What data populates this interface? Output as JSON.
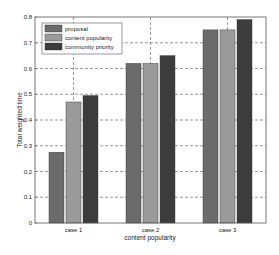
{
  "chart_data": {
    "type": "bar",
    "title": "",
    "xlabel": "content popularity",
    "ylabel": "Total weighted time",
    "categories": [
      "case 1",
      "case 2",
      "case 3"
    ],
    "series": [
      {
        "name": "proposal",
        "color": "#6b6b6b",
        "values": [
          0.275,
          0.62,
          0.75
        ]
      },
      {
        "name": "content popularity",
        "color": "#9a9a9a",
        "values": [
          0.47,
          0.62,
          0.75
        ]
      },
      {
        "name": "community priority",
        "color": "#3c3c3c",
        "values": [
          0.495,
          0.65,
          0.79
        ]
      }
    ],
    "ylim": [
      0,
      0.8
    ],
    "yticks": [
      "0",
      "0.1",
      "0.2",
      "0.3",
      "0.4",
      "0.5",
      "0.6",
      "0.7",
      "0.8"
    ],
    "grid": true,
    "legend_position": "upper left"
  }
}
